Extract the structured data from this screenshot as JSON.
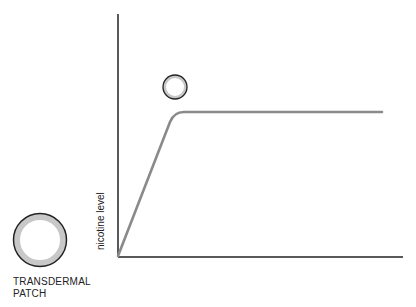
{
  "diagram": {
    "axis": {
      "ylabel": "nicotine level",
      "xlabel": ""
    },
    "curve": {
      "description": "Nicotine level rises steadily then plateaus",
      "color": "#8a8a8a",
      "points": [
        [
          118,
          256
        ],
        [
          170,
          120
        ],
        [
          180,
          112
        ],
        [
          382,
          112
        ]
      ]
    },
    "patch": {
      "label_line1": "TRANSDERMAL",
      "label_line2": "PATCH",
      "ring_color": "#c8c8c8",
      "outline_color": "#222222"
    },
    "small_circle": {
      "ring_color": "#c8c8c8",
      "outline_color": "#222222"
    }
  }
}
